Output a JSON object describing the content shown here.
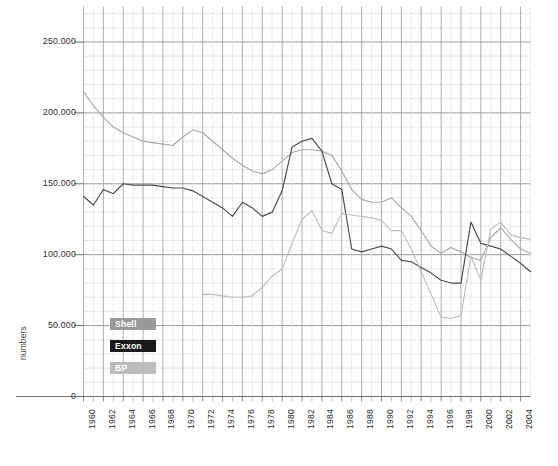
{
  "chart_data": {
    "type": "line",
    "title": "",
    "xlabel": "",
    "ylabel": "numbers",
    "xlim": [
      1960,
      2005
    ],
    "ylim": [
      0,
      275000
    ],
    "grid": true,
    "legend_position": "inside-left-lower",
    "x": [
      1960,
      1961,
      1962,
      1963,
      1964,
      1965,
      1966,
      1967,
      1968,
      1969,
      1970,
      1971,
      1972,
      1973,
      1974,
      1975,
      1976,
      1977,
      1978,
      1979,
      1980,
      1981,
      1982,
      1983,
      1984,
      1985,
      1986,
      1987,
      1988,
      1989,
      1990,
      1991,
      1992,
      1993,
      1994,
      1995,
      1996,
      1997,
      1998,
      1999,
      2000,
      2001,
      2002,
      2003,
      2004,
      2005
    ],
    "xtick_labels": [
      "1960",
      "1962",
      "1964",
      "1966",
      "1968",
      "1970",
      "1972",
      "1974",
      "1976",
      "1978",
      "1980",
      "1982",
      "1984",
      "1986",
      "1988",
      "1990",
      "1992",
      "1994",
      "1996",
      "1998",
      "2000",
      "2002",
      "2004"
    ],
    "ytick_labels": [
      "0",
      "50.000",
      "100.000",
      "150.000",
      "200.000",
      "250.000"
    ],
    "ytick_values": [
      0,
      50000,
      100000,
      150000,
      200000,
      250000
    ],
    "y_major_step": 50000,
    "y_minor_step": 10000,
    "series": [
      {
        "name": "Shell",
        "color": "#a8a8a8",
        "x": [
          1960,
          1961,
          1962,
          1963,
          1964,
          1965,
          1966,
          1967,
          1968,
          1969,
          1970,
          1971,
          1972,
          1973,
          1974,
          1975,
          1976,
          1977,
          1978,
          1979,
          1980,
          1981,
          1982,
          1983,
          1984,
          1985,
          1986,
          1987,
          1988,
          1989,
          1990,
          1991,
          1992,
          1993,
          1994,
          1995,
          1996,
          1997,
          1998,
          1999,
          2000,
          2001,
          2002,
          2003,
          2004,
          2005
        ],
        "values": [
          215000,
          205000,
          197000,
          190000,
          186000,
          183000,
          180000,
          179000,
          178000,
          177000,
          183000,
          188000,
          186000,
          180000,
          174000,
          168000,
          163000,
          159000,
          157000,
          160000,
          166000,
          172000,
          174000,
          174000,
          173000,
          170000,
          159000,
          146000,
          139000,
          137000,
          137000,
          140000,
          133000,
          127000,
          117000,
          106000,
          101000,
          105000,
          102000,
          98000,
          96000,
          112000,
          119000,
          111000,
          104000,
          101000
        ]
      },
      {
        "name": "Exxon",
        "color": "#4a4a4a",
        "x": [
          1960,
          1961,
          1962,
          1963,
          1964,
          1965,
          1966,
          1967,
          1968,
          1969,
          1970,
          1971,
          1972,
          1973,
          1974,
          1975,
          1976,
          1977,
          1978,
          1979,
          1980,
          1981,
          1982,
          1983,
          1984,
          1985,
          1986,
          1987,
          1988,
          1989,
          1990,
          1991,
          1992,
          1993,
          1994,
          1995,
          1996,
          1997,
          1998,
          1999,
          2000,
          2001,
          2002,
          2003,
          2004,
          2005
        ],
        "values": [
          141000,
          135000,
          146000,
          143000,
          150000,
          149000,
          149000,
          149000,
          148000,
          147000,
          147000,
          145000,
          141000,
          137000,
          133000,
          127000,
          137000,
          133000,
          127000,
          130000,
          145000,
          176000,
          180000,
          182000,
          173000,
          150000,
          146000,
          104000,
          102000,
          104000,
          106000,
          104000,
          96000,
          95000,
          91000,
          87000,
          82000,
          80000,
          80000,
          123000,
          108000,
          106000,
          104000,
          99000,
          94000,
          88000
        ]
      },
      {
        "name": "BP",
        "color": "#bdbdbd",
        "x": [
          1972,
          1973,
          1974,
          1975,
          1976,
          1977,
          1978,
          1979,
          1980,
          1981,
          1982,
          1983,
          1984,
          1985,
          1986,
          1987,
          1988,
          1989,
          1990,
          1991,
          1992,
          1993,
          1994,
          1995,
          1996,
          1997,
          1998,
          1999,
          2000,
          2001,
          2002,
          2003,
          2004,
          2005
        ],
        "values": [
          72000,
          72000,
          71000,
          70000,
          70000,
          71000,
          77000,
          85000,
          90000,
          108000,
          125000,
          131000,
          117000,
          115000,
          129000,
          128000,
          127000,
          126000,
          124000,
          117000,
          117000,
          104000,
          88000,
          72000,
          56000,
          55000,
          57000,
          99000,
          82000,
          118000,
          123000,
          114000,
          112000,
          111000
        ]
      }
    ]
  },
  "legend": {
    "items": [
      {
        "label": "Shell",
        "bg": "#9a9a9a",
        "fg": "#ffffff"
      },
      {
        "label": "Exxon",
        "bg": "#1a1a1a",
        "fg": "#ffffff"
      },
      {
        "label": "BP",
        "bg": "#bcbcbc",
        "fg": "#ffffff"
      }
    ]
  },
  "axes": {
    "y_title": "numbers"
  }
}
